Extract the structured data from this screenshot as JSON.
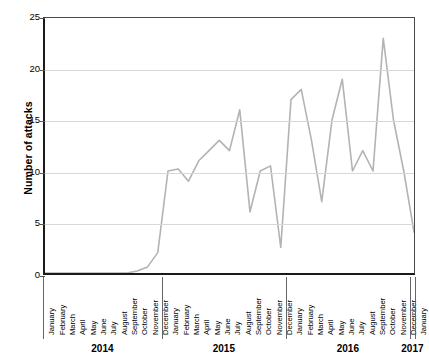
{
  "chart_data": {
    "type": "line",
    "title": "",
    "xlabel": "",
    "ylabel": "Number of attacks",
    "ylim": [
      0,
      25
    ],
    "yticks": [
      0,
      5,
      10,
      15,
      20,
      25
    ],
    "grid": true,
    "legend": false,
    "line_color": "#b3b3b3",
    "axis_color": "#1a1a1a",
    "grid_color": "#d8d8d8",
    "years": [
      "2014",
      "2015",
      "2016",
      "2017"
    ],
    "year_group_counts": [
      12,
      12,
      12,
      1
    ],
    "months": [
      "January",
      "February",
      "March",
      "April",
      "May",
      "June",
      "July",
      "August",
      "September",
      "October",
      "November",
      "December"
    ],
    "categories": [
      "January 2014",
      "February 2014",
      "March 2014",
      "April 2014",
      "May 2014",
      "June 2014",
      "July 2014",
      "August 2014",
      "September 2014",
      "October 2014",
      "November 2014",
      "December 2014",
      "January 2015",
      "February 2015",
      "March 2015",
      "April 2015",
      "May 2015",
      "June 2015",
      "July 2015",
      "August 2015",
      "September 2015",
      "October 2015",
      "November 2015",
      "December 2015",
      "January 2016",
      "February 2016",
      "March 2016",
      "April 2016",
      "May 2016",
      "June 2016",
      "July 2016",
      "August 2016",
      "September 2016",
      "October 2016",
      "November 2016",
      "December 2016",
      "January 2017"
    ],
    "x_tick_labels": [
      "January",
      "February",
      "March",
      "April",
      "May",
      "June",
      "July",
      "August",
      "September",
      "October",
      "November",
      "December",
      "January",
      "February",
      "March",
      "April",
      "May",
      "June",
      "July",
      "August",
      "September",
      "October",
      "November",
      "December",
      "January",
      "February",
      "March",
      "April",
      "May",
      "June",
      "July",
      "August",
      "September",
      "October",
      "November",
      "December",
      "January"
    ],
    "values": [
      0,
      0,
      0,
      0,
      0,
      0,
      0,
      0,
      0,
      0.2,
      0.6,
      2,
      10,
      10.2,
      9,
      11,
      12,
      13,
      12,
      16,
      6,
      10,
      10.5,
      2.5,
      17,
      18,
      13,
      7,
      15,
      19,
      10,
      12,
      10,
      23,
      15,
      10,
      4
    ]
  }
}
